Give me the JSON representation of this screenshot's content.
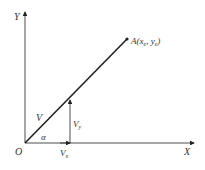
{
  "diagram": {
    "axes": {
      "x_label": "X",
      "y_label": "Y",
      "origin_label": "O"
    },
    "point": {
      "label_prefix": "A(x",
      "sub1": "e",
      "mid": ", y",
      "sub2": "e",
      "suffix": ")"
    },
    "vector_label": "V",
    "angle_label": "α",
    "vx_label": "V",
    "vx_sub": "x",
    "vy_label": "V",
    "vy_sub": "y",
    "colors": {
      "line": "#222222",
      "text": "#333333"
    }
  }
}
